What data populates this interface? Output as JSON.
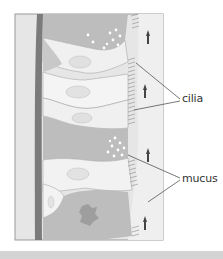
{
  "figure": {
    "labels": {
      "cilia": "cilia",
      "mucus": "mucus"
    }
  },
  "colors": {
    "background": "#ffffff",
    "frame_border": "#9a9a9a",
    "connective_tissue": "#e4e4e4",
    "basement_membrane": "#7b7b7b",
    "goblet_cell": "#bdbdbd",
    "ciliated_cell": "#f1f1f1",
    "nucleus": "#e0e0e0",
    "mucus_layer": "#ececec",
    "bottom_bar": "#d4d4d4",
    "label_text": "#333333",
    "leader_line": "#555555"
  }
}
